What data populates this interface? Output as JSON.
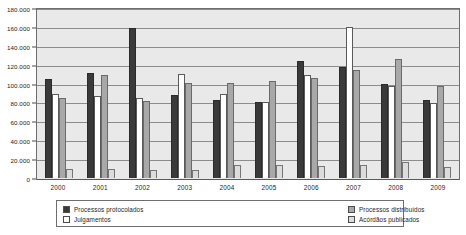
{
  "chart_data": {
    "type": "bar",
    "title": "",
    "xlabel": "",
    "ylabel": "",
    "ylim": [
      0,
      180000
    ],
    "ytick_step": 20000,
    "grid": true,
    "legend_position": "bottom",
    "categories": [
      "2000",
      "2001",
      "2002",
      "2003",
      "2004",
      "2005",
      "2006",
      "2007",
      "2008",
      "2009"
    ],
    "ytick_labels": [
      "180.000",
      "160.000",
      "140.000",
      "120.000",
      "100.000",
      "80.000",
      "60.000",
      "40.000",
      "20.000",
      "0"
    ],
    "ytick_values": [
      180000,
      160000,
      140000,
      120000,
      100000,
      80000,
      60000,
      40000,
      20000,
      0
    ],
    "series": [
      {
        "name": "Processos protocolados",
        "color": "#3a3a3a",
        "values": [
          105000,
          111000,
          159000,
          88000,
          83000,
          80000,
          124000,
          118000,
          100000,
          83000
        ]
      },
      {
        "name": "Julgamentos",
        "color": "#ffffff",
        "values": [
          89000,
          87000,
          85000,
          110000,
          89000,
          81000,
          109000,
          160000,
          97000,
          79000
        ]
      },
      {
        "name": "Processos distribuídos",
        "color": "#a8a8a8",
        "values": [
          85000,
          109000,
          82000,
          101000,
          101000,
          103000,
          106000,
          114000,
          126000,
          97000
        ]
      },
      {
        "name": "Acórdãos publicados",
        "color": "#dcdcdc",
        "values": [
          10000,
          10000,
          9000,
          8000,
          14000,
          14000,
          13000,
          14000,
          17000,
          12000
        ]
      }
    ]
  },
  "legend": {
    "entries": [
      {
        "label": "Processos protocolados",
        "swatch": "#3a3a3a"
      },
      {
        "label": "Processos distribuídos",
        "swatch": "#a8a8a8"
      },
      {
        "label": "Julgamentos",
        "swatch": "#ffffff"
      },
      {
        "label": "Acórdãos publicados",
        "swatch": "#dcdcdc"
      }
    ]
  }
}
